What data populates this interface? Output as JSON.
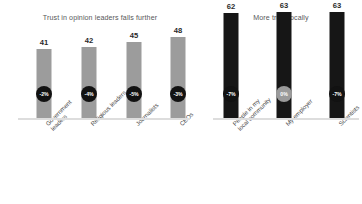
{
  "chart_data": {
    "type": "bar",
    "title": "",
    "xlabel": "",
    "ylabel": "",
    "ylim": [
      0,
      70
    ],
    "grid": false,
    "legend": "none",
    "panels": [
      {
        "title": "Trust in opinion leaders falls further",
        "bar_color": "#9c9c9c",
        "categories": [
          "Government\nleaders",
          "Religious leaders",
          "Journalists",
          "CEOs"
        ],
        "values": [
          41,
          42,
          45,
          48
        ],
        "change_labels": [
          "-2%",
          "-4%",
          "-5%",
          "-3%"
        ],
        "change_badge_colors": [
          "#121212",
          "#121212",
          "#121212",
          "#121212"
        ]
      },
      {
        "title": "More trust locally",
        "bar_color": "#161616",
        "categories": [
          "People in my\nlocal community",
          "My employer",
          "Scientists"
        ],
        "values": [
          62,
          63,
          63
        ],
        "change_labels": [
          "-7%",
          "0%",
          "-7%"
        ],
        "change_badge_colors": [
          "#121212",
          "#9a9a9a",
          "#121212"
        ]
      }
    ]
  },
  "colors": {
    "background": "#ffffff",
    "baseline": "#dddddd",
    "title_text": "#58585a",
    "value_text": "#2b2b2b",
    "category_text": "#4a4a4a"
  }
}
